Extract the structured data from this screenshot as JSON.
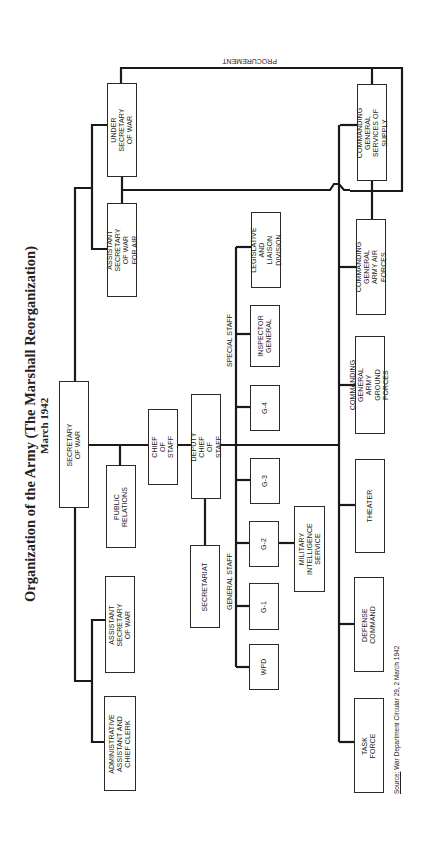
{
  "title": "Organization of the Army (The Marshall Reorganization)",
  "subtitle": "March 1942",
  "source": {
    "prefix": "Source:",
    "text": " War Department Circular 29, 2 March 1942"
  },
  "labels": {
    "procurement": "PROCUREMENT",
    "general_staff": "GENERAL STAFF",
    "special_staff": "SPECIAL STAFF"
  },
  "boxes": {
    "under_secretary": "UNDER SECRETARY\nOF WAR",
    "asst_sec_air": "ASSISTANT SECRETARY\nOF WAR FOR AIR",
    "secretary_of_war": "SECRETARY OF WAR",
    "public_relations": "PUBLIC\nRELATIONS",
    "asst_sec_war": "ASSISTANT SECRETARY\nOF WAR",
    "admin_assistant": "ADMINISTRATIVE\nASSISTANT AND\nCHIEF CLERK",
    "chief_of_staff": "CHIEF OF STAFF",
    "deputy_chief": "DEPUTY CHIEF OF STAFF",
    "secretariat": "SECRETARIAT",
    "legislative": "LEGISLATIVE AND\nLIAISON DIVISION",
    "inspector_general": "INSPECTOR\nGENERAL",
    "g4": "G-4",
    "g3": "G-3",
    "g2": "G-2",
    "mis": "MILITARY\nINTELLIGENCE\nSERVICE",
    "g1": "G-1",
    "wpd": "WPD",
    "cg_sos": "COMMANDING GENERAL\nSERVICES OF SUPPLY",
    "cg_aaf": "COMMANDING GENERAL\nARMY AIR FORCES",
    "cg_agf": "COMMANDING GENERAL\nARMY GROUND FORCES",
    "theater": "THEATER",
    "defense_command": "DEFENSE COMMAND",
    "task_force": "TASK FORCE"
  },
  "colors": {
    "line": "#1a1a1a",
    "border": "#2a2a2a",
    "background": "#ffffff"
  }
}
